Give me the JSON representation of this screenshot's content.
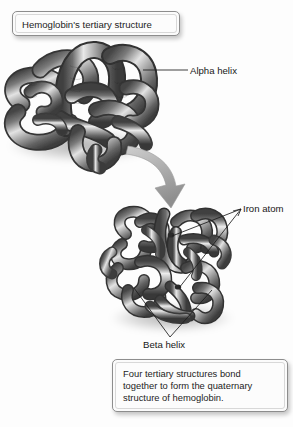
{
  "figure": {
    "title_box": {
      "text": "Hemoglobin's tertiary structure"
    },
    "bottom_box": {
      "text": "Four tertiary structures bond\ntogether to form the quaternary\nstructure of hemoglobin."
    },
    "labels": {
      "alpha_helix": "Alpha helix",
      "iron_atom": "Iron atom",
      "beta_helix": "Beta helix"
    },
    "icons": {
      "arrow": "curved-down-arrow-icon",
      "tertiary": "tertiary-structure-illustration",
      "quaternary": "quaternary-structure-illustration"
    },
    "colors": {
      "background": "#fdfdfd",
      "box_border": "#8d8d8d",
      "text": "#1c1c1c",
      "leader_line": "#1d1d1d",
      "protein_dark": "#4a4a4a",
      "protein_mid": "#8e8e8e",
      "protein_light": "#dcdcdc",
      "arrow_fill": "#a9a9a9",
      "shadow": "rgba(0,0,0,0.22)"
    }
  }
}
